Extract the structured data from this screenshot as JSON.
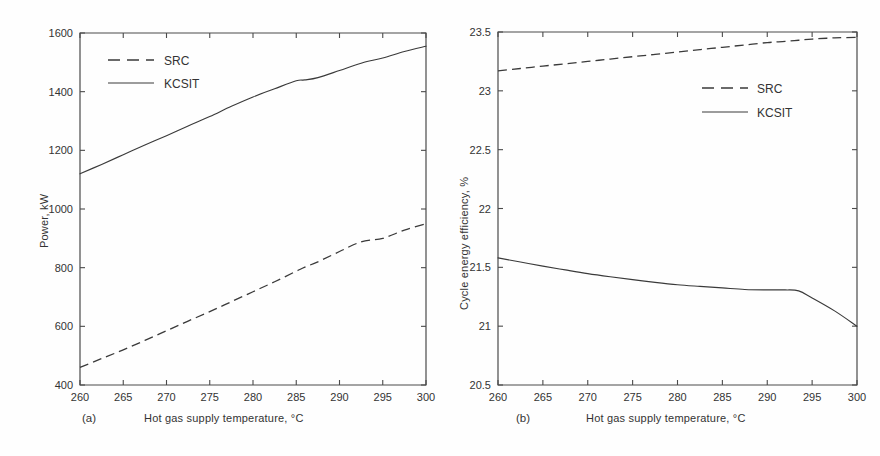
{
  "figure": {
    "background": "#ffffff",
    "line_color": "#3a3a3a",
    "axis_color": "#4a4a4a"
  },
  "panels": [
    {
      "tag": "(a)",
      "xlabel": "Hot gas supply temperature, °C",
      "ylabel": "Power, kW",
      "legend_position": "top-left"
    },
    {
      "tag": "(b)",
      "xlabel": "Hot gas supply temperature, °C",
      "ylabel": "Cycle energy efficiency, %",
      "legend_position": "right"
    }
  ],
  "chart_data": [
    {
      "type": "line",
      "title": "",
      "panel_tag": "(a)",
      "xlabel": "Hot gas supply temperature, °C",
      "ylabel": "Power, kW",
      "xlim": [
        260,
        300
      ],
      "ylim": [
        400,
        1600
      ],
      "xticks": [
        260,
        265,
        270,
        275,
        280,
        285,
        290,
        295,
        300
      ],
      "yticks": [
        400,
        600,
        800,
        1000,
        1200,
        1400,
        1600
      ],
      "xticklabels": [
        "260",
        "265",
        "270",
        "275",
        "280",
        "285",
        "290",
        "295",
        "300"
      ],
      "yticklabels": [
        "400",
        "600",
        "800",
        "1000",
        "1200",
        "1400",
        "1600"
      ],
      "grid": false,
      "legend": [
        "SRC",
        "KCSIT"
      ],
      "legend_position": "top-left",
      "x": [
        260,
        262.5,
        265,
        267.5,
        270,
        272.5,
        275,
        277.5,
        280,
        282.5,
        285,
        286,
        287.5,
        290,
        292.5,
        295,
        297.5,
        300
      ],
      "series": [
        {
          "name": "SRC",
          "style": "dashed",
          "values": [
            460,
            490,
            520,
            552,
            585,
            618,
            650,
            684,
            718,
            752,
            788,
            802,
            820,
            855,
            888,
            900,
            928,
            950
          ]
        },
        {
          "name": "KCSIT",
          "style": "solid",
          "values": [
            1120,
            1152,
            1185,
            1218,
            1250,
            1283,
            1315,
            1350,
            1382,
            1410,
            1437,
            1440,
            1448,
            1472,
            1497,
            1515,
            1537,
            1555
          ]
        }
      ]
    },
    {
      "type": "line",
      "title": "",
      "panel_tag": "(b)",
      "xlabel": "Hot gas supply temperature, °C",
      "ylabel": "Cycle energy efficiency, %",
      "xlim": [
        260,
        300
      ],
      "ylim": [
        20.5,
        23.5
      ],
      "xticks": [
        260,
        265,
        270,
        275,
        280,
        285,
        290,
        295,
        300
      ],
      "yticks": [
        20.5,
        21,
        21.5,
        22,
        22.5,
        23,
        23.5
      ],
      "xticklabels": [
        "260",
        "265",
        "270",
        "275",
        "280",
        "285",
        "290",
        "295",
        "300"
      ],
      "yticklabels": [
        "20.5",
        "21",
        "21.5",
        "22",
        "22.5",
        "23",
        "23.5"
      ],
      "grid": false,
      "legend": [
        "SRC",
        "KCSIT"
      ],
      "legend_position": "right",
      "x": [
        260,
        262.5,
        265,
        267.5,
        270,
        272.5,
        275,
        277.5,
        280,
        282.5,
        285,
        287.5,
        290,
        292,
        293.5,
        295,
        297.5,
        300
      ],
      "series": [
        {
          "name": "SRC",
          "style": "dashed",
          "values": [
            23.17,
            23.19,
            23.21,
            23.23,
            23.25,
            23.27,
            23.29,
            23.31,
            23.33,
            23.35,
            23.37,
            23.39,
            23.41,
            23.42,
            23.43,
            23.44,
            23.45,
            23.455
          ]
        },
        {
          "name": "KCSIT",
          "style": "solid",
          "values": [
            21.58,
            21.545,
            21.51,
            21.478,
            21.447,
            21.42,
            21.395,
            21.372,
            21.352,
            21.338,
            21.325,
            21.312,
            21.308,
            21.308,
            21.3,
            21.24,
            21.13,
            21.0
          ]
        }
      ]
    }
  ]
}
